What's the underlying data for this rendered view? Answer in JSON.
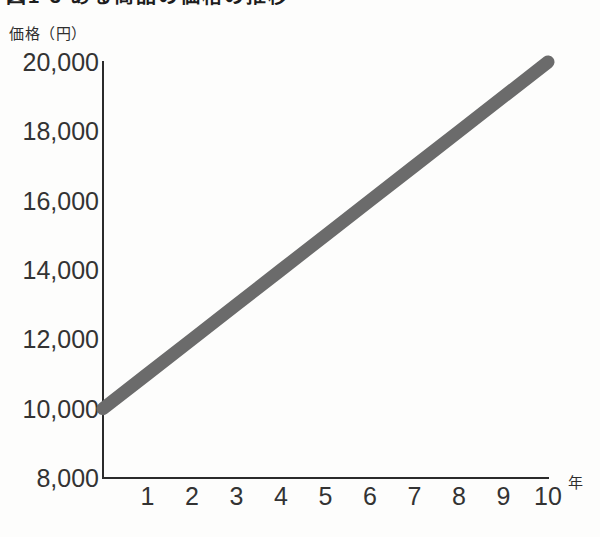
{
  "figure": {
    "title_cropped": "図1-3 ある商品の価格の推移",
    "y_axis_caption": "価格（円）",
    "x_axis_unit": "年"
  },
  "colors": {
    "background": "#fdfdfc",
    "axis": "#2b2b2b",
    "series_line": "#6b6b6b",
    "text": "#333333"
  },
  "chart_data": {
    "type": "line",
    "title": "図1-3 ある商品の価格の推移",
    "xlabel": "年",
    "ylabel": "価格（円）",
    "x": [
      0,
      1,
      2,
      3,
      4,
      5,
      6,
      7,
      8,
      9,
      10
    ],
    "series": [
      {
        "name": "価格",
        "values": [
          10000,
          11000,
          12000,
          13000,
          14000,
          15000,
          16000,
          17000,
          18000,
          19000,
          20000
        ]
      }
    ],
    "xlim": [
      0,
      10
    ],
    "ylim": [
      8000,
      20000
    ],
    "xticks": [
      1,
      2,
      3,
      4,
      5,
      6,
      7,
      8,
      9,
      10
    ],
    "xtick_labels": [
      "1",
      "2",
      "3",
      "4",
      "5",
      "6",
      "7",
      "8",
      "9",
      "10"
    ],
    "yticks": [
      8000,
      10000,
      12000,
      14000,
      16000,
      18000,
      20000
    ],
    "ytick_labels": [
      "8,000",
      "10,000",
      "12,000",
      "14,000",
      "16,000",
      "18,000",
      "20,000"
    ],
    "grid": false,
    "legend": false,
    "annotations": []
  }
}
